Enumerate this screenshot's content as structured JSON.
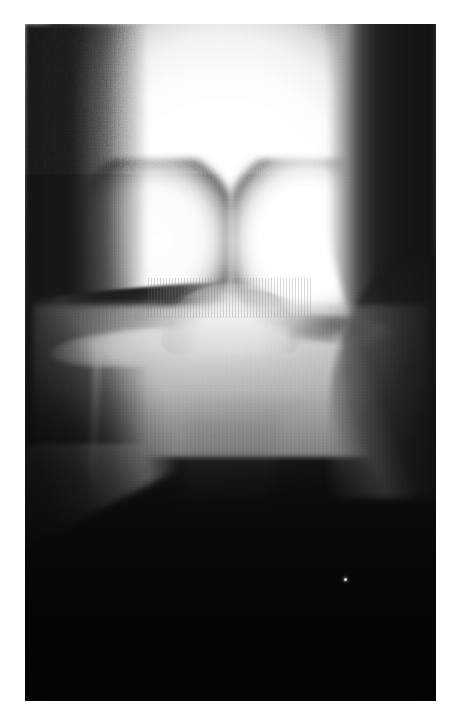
{
  "page": {
    "background_color": "#ffffff",
    "width": 459,
    "height": 727
  },
  "radiograph": {
    "name": "knee-radiograph",
    "modality": "X-ray",
    "body_part": "knee",
    "view": "anteroposterior / intercondylar (tunnel) view",
    "orientation": "portrait",
    "frame": {
      "left": 25,
      "top": 24,
      "width": 411,
      "height": 677
    },
    "palette": {
      "page_background": "#ffffff",
      "film_darkest": "#121212",
      "film_dark": "#1a1a1a",
      "film_midtone": "#6d6d6d",
      "bone_bright": "#ffffff",
      "bone_edge": "#d8d8d8",
      "joint_space_shadow": "#0a0a0a"
    },
    "anatomy": [
      {
        "id": "distal-femur",
        "label": "Distal femur (overexposed bright mass)",
        "region": "upper two-fifths of the film"
      },
      {
        "id": "medial-femoral-condyle",
        "label": "Medial femoral condyle",
        "region": "upper left of the joint"
      },
      {
        "id": "lateral-femoral-condyle",
        "label": "Lateral femoral condyle",
        "region": "upper right of the joint"
      },
      {
        "id": "medial-joint-space",
        "label": "Medial joint space (dark crescent)",
        "region": "left of centre at mid-height"
      },
      {
        "id": "lateral-joint-space",
        "label": "Lateral joint space (dark crescent)",
        "region": "right of centre at mid-height"
      },
      {
        "id": "tibial-intercondylar-eminence",
        "label": "Tibial intercondylar eminence (tibial spines)",
        "region": "centre, mound shaped"
      },
      {
        "id": "tibial-plateau",
        "label": "Tibial plateau and proximal metaphysis",
        "region": "below the joint line"
      },
      {
        "id": "proximal-tibia",
        "label": "Proximal tibial shaft fading into underexposure",
        "region": "lower half of the film"
      },
      {
        "id": "soft-tissue-margin-left",
        "label": "Soft tissue / collimation shadow, left oblique margin",
        "region": "upper left diagonal"
      },
      {
        "id": "soft-tissue-margin-right",
        "label": "Soft tissue / collimation shadow, right curved margin",
        "region": "right edge"
      }
    ],
    "artifacts": [
      {
        "id": "vertical-striations",
        "label": "Vertical scan-line striations"
      },
      {
        "id": "film-grain",
        "label": "Film grain / digitisation noise"
      },
      {
        "id": "bright-speck",
        "label": "Bright dust speck in lower film",
        "position_percent": {
          "x": 77.6,
          "y": 81.8
        }
      }
    ],
    "text_overlays": []
  }
}
